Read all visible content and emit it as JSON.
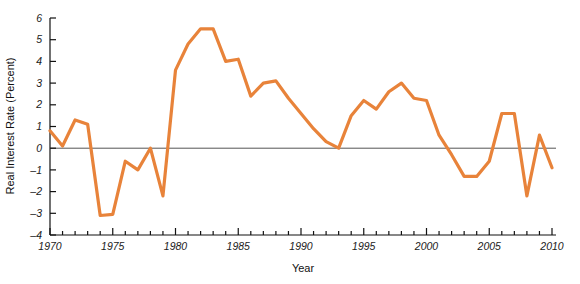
{
  "chart_data": {
    "type": "line",
    "title": "",
    "xlabel": "Year",
    "ylabel": "Real Interest Rate (Percent)",
    "xlim": [
      1970,
      2010
    ],
    "ylim": [
      -4,
      6
    ],
    "grid": false,
    "legend": "none",
    "zero_reference_line": true,
    "x_tick_interval": 1,
    "x_label_interval": 5,
    "y_tick_interval": 1,
    "line_color": "#E8833A",
    "axis_color": "#111111",
    "zero_line_color": "#555555",
    "x_tick_labels": [
      "1970",
      "1975",
      "1980",
      "1985",
      "1990",
      "1995",
      "2000",
      "2005",
      "2010"
    ],
    "y_tick_labels": [
      "6",
      "5",
      "4",
      "3",
      "2",
      "1",
      "0",
      "-1",
      "-2",
      "-3",
      "-4"
    ],
    "series": [
      {
        "name": "Real Interest Rate",
        "x": [
          1970,
          1971,
          1972,
          1973,
          1974,
          1975,
          1976,
          1977,
          1978,
          1979,
          1980,
          1981,
          1982,
          1983,
          1984,
          1985,
          1986,
          1987,
          1988,
          1989,
          1990,
          1991,
          1992,
          1993,
          1994,
          1995,
          1996,
          1997,
          1998,
          1999,
          2000,
          2001,
          2002,
          2003,
          2004,
          2005,
          2006,
          2007,
          2008,
          2009,
          2010
        ],
        "values": [
          0.8,
          0.1,
          1.3,
          1.1,
          -3.1,
          -3.05,
          -0.6,
          -1.0,
          0.0,
          -2.2,
          3.6,
          4.8,
          5.5,
          5.5,
          4.0,
          4.1,
          2.4,
          3.0,
          3.1,
          2.3,
          1.6,
          0.9,
          0.3,
          0.0,
          1.5,
          2.2,
          1.8,
          2.6,
          3.0,
          2.3,
          2.2,
          0.6,
          -0.3,
          -1.3,
          -1.3,
          -0.6,
          1.6,
          1.6,
          -2.2,
          0.6,
          -0.9
        ]
      }
    ]
  }
}
